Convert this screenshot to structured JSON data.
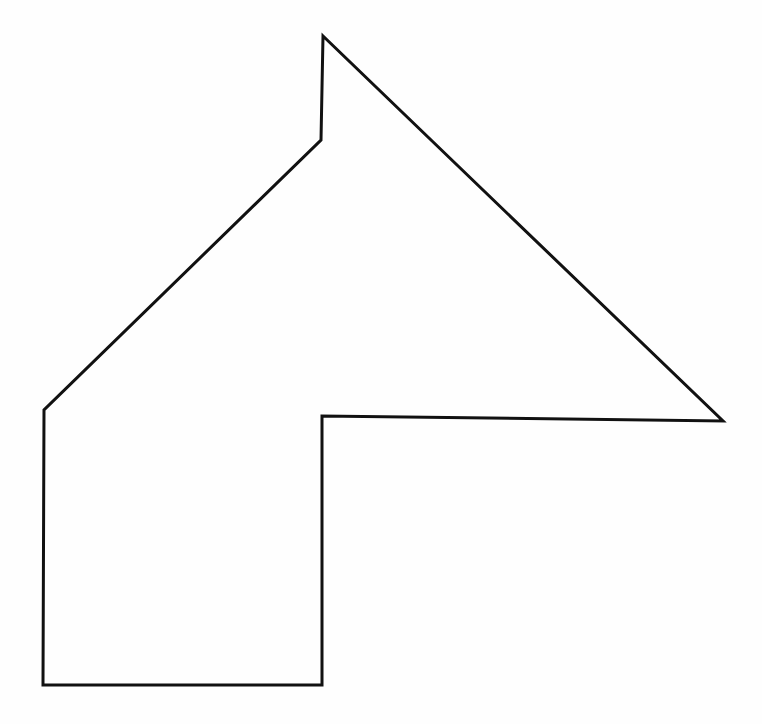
{
  "page": {
    "background_color": "#fefefe",
    "width": 762,
    "height": 724
  },
  "figure": {
    "name": "arrow-polygon-outline",
    "stroke_color": "#111111",
    "fill_color": "none",
    "stroke_width": 3,
    "closed": true,
    "vertex_count": 7,
    "vertices": [
      {
        "label": "apex",
        "x": 323,
        "y": 36
      },
      {
        "label": "right-tip",
        "x": 723,
        "y": 421
      },
      {
        "label": "inner-corner",
        "x": 322,
        "y": 416
      },
      {
        "label": "stem-bottom-right",
        "x": 322,
        "y": 685
      },
      {
        "label": "stem-bottom-left",
        "x": 43,
        "y": 685
      },
      {
        "label": "left-vertex",
        "x": 44,
        "y": 410
      },
      {
        "label": "notch-vertex",
        "x": 321,
        "y": 140
      }
    ],
    "path_d": "M 323 36 L 723 421 L 322 416 L 322 685 L 43 685 L 44 410 L 321 140 Z",
    "edges": [
      {
        "from": "apex",
        "to": "right-tip",
        "kind": "diagonal-down-right"
      },
      {
        "from": "right-tip",
        "to": "inner-corner",
        "kind": "horizontal-left"
      },
      {
        "from": "inner-corner",
        "to": "stem-bottom-right",
        "kind": "vertical-down"
      },
      {
        "from": "stem-bottom-right",
        "to": "stem-bottom-left",
        "kind": "horizontal-left"
      },
      {
        "from": "stem-bottom-left",
        "to": "left-vertex",
        "kind": "vertical-up"
      },
      {
        "from": "left-vertex",
        "to": "notch-vertex",
        "kind": "diagonal-up-right"
      },
      {
        "from": "notch-vertex",
        "to": "apex",
        "kind": "vertical-up"
      }
    ]
  }
}
